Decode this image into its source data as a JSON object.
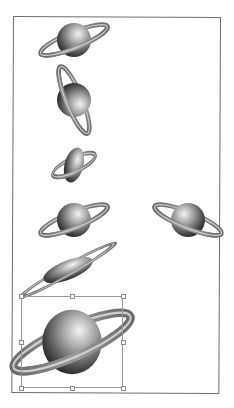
{
  "canvas": {
    "frame_color": "#6e6e6e",
    "background": "#ffffff"
  },
  "colors": {
    "sphere_highlight": "#f2f2f2",
    "sphere_mid": "#8a8a8a",
    "sphere_shadow": "#1e1e1e",
    "ring_outer": "#7a7a7a",
    "ring_inner": "#c8c8c8",
    "selection_border": "#9a9a9a",
    "handle_fill": "#ffffff",
    "handle_border": "#8a8a8a"
  },
  "planets": [
    {
      "id": "original",
      "label": "planet-original",
      "cx": 74,
      "cy": 40,
      "scale_x": 1,
      "scale_y": 1,
      "rotate": 0,
      "skew": 0
    },
    {
      "id": "rotated-90",
      "label": "planet-vertical-ring",
      "cx": 74,
      "cy": 100,
      "scale_x": 1,
      "scale_y": 1,
      "rotate": 90,
      "skew": 0
    },
    {
      "id": "squashed",
      "label": "planet-squashed",
      "cx": 74,
      "cy": 165,
      "scale_x": 0.55,
      "scale_y": 1.05,
      "rotate": 15,
      "skew": 0
    },
    {
      "id": "copy",
      "label": "planet-copy",
      "cx": 74,
      "cy": 220,
      "scale_x": 1,
      "scale_y": 1,
      "rotate": 0,
      "skew": 0
    },
    {
      "id": "reflected",
      "label": "planet-reflected",
      "cx": 188,
      "cy": 220,
      "scale_x": -1,
      "scale_y": 1,
      "rotate": 0,
      "skew": 0
    },
    {
      "id": "sheared",
      "label": "planet-sheared",
      "cx": 68,
      "cy": 270,
      "scale_x": 1.55,
      "scale_y": 0.55,
      "rotate": -22,
      "skew": 0
    },
    {
      "id": "scaled",
      "label": "planet-scaled-selected",
      "cx": 72,
      "cy": 342,
      "scale_x": 1.75,
      "scale_y": 1.9,
      "rotate": 0,
      "skew": 0
    }
  ],
  "selection": {
    "x": 21,
    "y": 296,
    "width": 102,
    "height": 92,
    "handles": [
      "top-left",
      "top-center",
      "top-right",
      "middle-left",
      "middle-right",
      "bottom-left",
      "bottom-center",
      "bottom-right"
    ]
  }
}
